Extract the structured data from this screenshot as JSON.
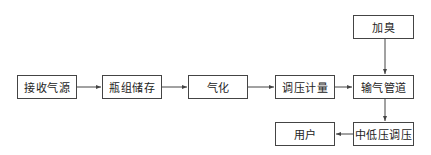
{
  "diagram": {
    "type": "flowchart",
    "nodes": [
      {
        "id": "receive",
        "label": "接收气源"
      },
      {
        "id": "storage",
        "label": "瓶组储存"
      },
      {
        "id": "vaporize",
        "label": "气化"
      },
      {
        "id": "regulate_meter",
        "label": "调压计量"
      },
      {
        "id": "pipeline",
        "label": "输气管道"
      },
      {
        "id": "odorize",
        "label": "加臭"
      },
      {
        "id": "mid_low_regulate",
        "label": "中低压调压"
      },
      {
        "id": "user",
        "label": "用户"
      }
    ],
    "edges": [
      {
        "from": "receive",
        "to": "storage"
      },
      {
        "from": "storage",
        "to": "vaporize"
      },
      {
        "from": "vaporize",
        "to": "regulate_meter"
      },
      {
        "from": "regulate_meter",
        "to": "pipeline"
      },
      {
        "from": "odorize",
        "to": "pipeline"
      },
      {
        "from": "pipeline",
        "to": "mid_low_regulate"
      },
      {
        "from": "mid_low_regulate",
        "to": "user"
      }
    ],
    "colors": {
      "line": "#444444",
      "text": "#222222",
      "background": "#ffffff"
    }
  }
}
